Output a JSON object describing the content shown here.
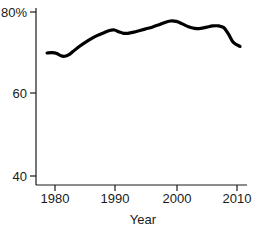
{
  "chart_data": {
    "type": "line",
    "title": "",
    "subtitle": "",
    "xlabel": "Year",
    "ylabel": "",
    "xlim": [
      1978,
      2011
    ],
    "ylim": [
      38,
      81
    ],
    "grid": false,
    "legend": null,
    "xticks": [
      1980,
      1990,
      2000,
      2010
    ],
    "xticklabels": [
      "1980",
      "1990",
      "2000",
      "2010"
    ],
    "yticks": [
      40,
      60,
      80
    ],
    "yticklabels": [
      "40",
      "60",
      "80%"
    ],
    "series": [
      {
        "name": "value",
        "color": "#000000",
        "x": [
          1978.7,
          1979.5,
          1980.3,
          1981.0,
          1981.6,
          1982.3,
          1983.0,
          1984.0,
          1985.0,
          1986.0,
          1987.0,
          1988.0,
          1989.0,
          1989.8,
          1990.6,
          1991.3,
          1992.0,
          1993.0,
          1994.0,
          1995.0,
          1996.0,
          1997.0,
          1998.0,
          1999.0,
          2000.0,
          2001.0,
          2002.0,
          2003.0,
          2004.0,
          2005.0,
          2006.0,
          2007.0,
          2007.8,
          2008.6,
          2009.4,
          2010.5
        ],
        "y": [
          70.0,
          70.1,
          69.9,
          69.3,
          69.2,
          69.6,
          70.4,
          71.6,
          72.6,
          73.5,
          74.3,
          74.9,
          75.5,
          75.6,
          75.1,
          74.8,
          74.8,
          75.1,
          75.5,
          75.9,
          76.3,
          76.8,
          77.4,
          77.8,
          77.7,
          77.1,
          76.4,
          76.0,
          76.0,
          76.3,
          76.6,
          76.6,
          76.2,
          74.6,
          72.6,
          71.6
        ]
      }
    ]
  },
  "labels": {
    "y_top": "80%",
    "y_mid": "60",
    "y_bottom": "40",
    "x_1": "1980",
    "x_2": "1990",
    "x_3": "2000",
    "x_4": "2010",
    "x_axis_title": "Year"
  }
}
